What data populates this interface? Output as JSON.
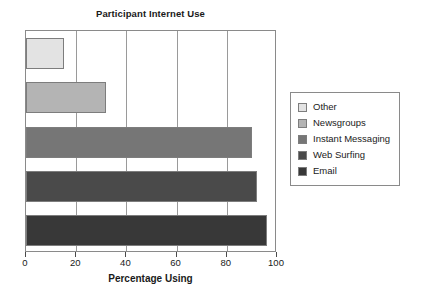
{
  "chart_data": {
    "type": "bar",
    "orientation": "horizontal",
    "title": "Participant Internet Use",
    "xlabel": "Percentage Using",
    "ylabel": "",
    "xlim": [
      0,
      100
    ],
    "xticks": [
      0,
      20,
      40,
      60,
      80,
      100
    ],
    "xtick_labels": [
      "0",
      "20",
      "40",
      "60",
      "80",
      "100"
    ],
    "grid": true,
    "grid_axis": "x",
    "legend_position": "right",
    "categories": [
      "Other",
      "Newsgroups",
      "Instant Messaging",
      "Web Surfing",
      "Email"
    ],
    "values": [
      15,
      32,
      90,
      92,
      96
    ],
    "series": [
      {
        "name": "Percentage Using",
        "points": [
          {
            "category": "Other",
            "value": 15,
            "color": "#e3e3e3"
          },
          {
            "category": "Newsgroups",
            "value": 32,
            "color": "#b4b4b4"
          },
          {
            "category": "Instant Messaging",
            "value": 90,
            "color": "#767676"
          },
          {
            "category": "Web Surfing",
            "value": 92,
            "color": "#4a4a4a"
          },
          {
            "category": "Email",
            "value": 96,
            "color": "#383838"
          }
        ]
      }
    ]
  },
  "legend": {
    "items": [
      {
        "label": "Other",
        "color": "#e3e3e3"
      },
      {
        "label": "Newsgroups",
        "color": "#b4b4b4"
      },
      {
        "label": "Instant Messaging",
        "color": "#767676"
      },
      {
        "label": "Web Surfing",
        "color": "#4a4a4a"
      },
      {
        "label": "Email",
        "color": "#383838"
      }
    ]
  },
  "colors": {
    "axis": "#8a8a8a",
    "gridline": "#9a9a9a",
    "text": "#1a1a1a",
    "background": "#ffffff"
  }
}
